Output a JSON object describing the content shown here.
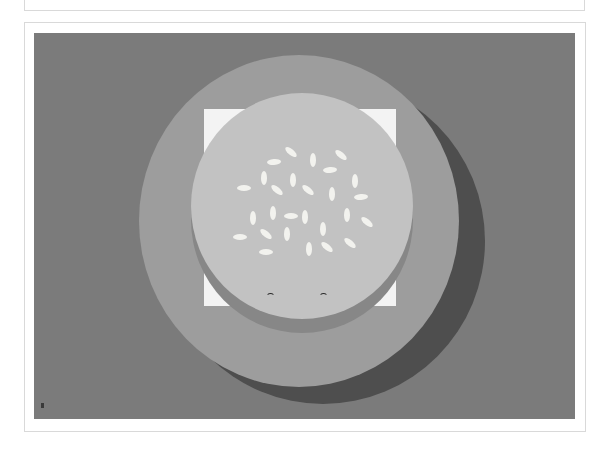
{
  "page": {
    "top_card": {},
    "main_card": {
      "illustration": {
        "subject": "burger bun with sesame seeds and smiling face on a plate",
        "colors": {
          "background": "#7b7b7b",
          "plate": "#9d9d9d",
          "plate_shadow": "#4e4e4e",
          "bun_base": "#888888",
          "bun_top": "#c2c2c2",
          "paper": "#f3f3f3",
          "seed": "#f2f2ee",
          "eyes": "#2a2a2a"
        },
        "seed_count": 26,
        "face": {
          "eyes": "smiling closed eyes"
        }
      }
    }
  }
}
